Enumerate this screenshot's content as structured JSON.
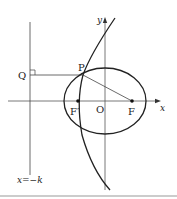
{
  "diagram": {
    "type": "conic-geometry",
    "labels": {
      "y_axis": "y",
      "x_axis": "x",
      "origin": "O",
      "point_p": "P",
      "point_q": "Q",
      "focus_left": "F′",
      "focus_right": "F",
      "directrix": "x=−k"
    },
    "colors": {
      "stroke": "#222222",
      "axis": "#555555",
      "separator": "#bbbbbb",
      "background": "#ffffff"
    }
  }
}
